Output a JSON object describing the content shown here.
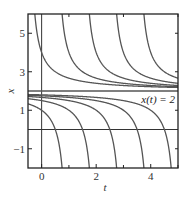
{
  "chart_data": {
    "type": "line",
    "title": "",
    "xlabel": "t",
    "ylabel": "x",
    "xlim": [
      -0.5,
      5
    ],
    "ylim": [
      -2,
      6
    ],
    "xticks": [
      0,
      2,
      4
    ],
    "xtick_labels": [
      "0",
      "2",
      "4"
    ],
    "xticks_minor": [
      1,
      3,
      5
    ],
    "yticks": [
      -1,
      1,
      3,
      5
    ],
    "ytick_labels": [
      "-1",
      "1",
      "3",
      "5"
    ],
    "yticks_minor": [
      0,
      2,
      4
    ],
    "grid": false,
    "reference_lines": [
      {
        "orientation": "vertical",
        "value": 0,
        "name": "x-axis-line-t0"
      },
      {
        "orientation": "horizontal",
        "value": 0,
        "name": "t-axis-line-x0"
      }
    ],
    "equilibrium": {
      "value": 2,
      "label": "x(t) = 2"
    },
    "solution_family": "x(t) = 2 + 1/(t - c)",
    "series": [
      {
        "name": "upper c=-0.5",
        "branch": "upper",
        "c": -0.5
      },
      {
        "name": "upper c=0.5",
        "branch": "upper",
        "c": 0.5
      },
      {
        "name": "upper c=1.5",
        "branch": "upper",
        "c": 1.5
      },
      {
        "name": "upper c=2.5",
        "branch": "upper",
        "c": 2.5
      },
      {
        "name": "upper c=3.5",
        "branch": "upper",
        "c": 3.5
      },
      {
        "name": "lower c=1",
        "branch": "lower",
        "c": 1
      },
      {
        "name": "lower c=2",
        "branch": "lower",
        "c": 2
      },
      {
        "name": "lower c=3",
        "branch": "lower",
        "c": 3
      },
      {
        "name": "lower c=4",
        "branch": "lower",
        "c": 4
      },
      {
        "name": "lower c=5",
        "branch": "lower",
        "c": 5
      }
    ],
    "line_color": "#555555",
    "frame_color": "#222222"
  }
}
